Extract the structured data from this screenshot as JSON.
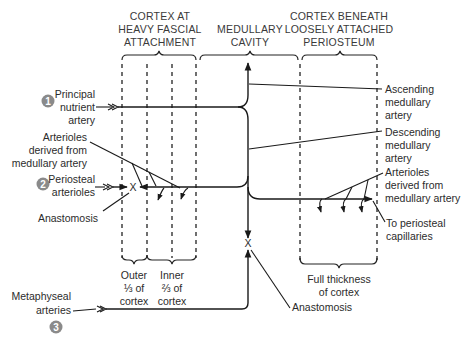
{
  "headers": {
    "left": [
      "CORTEX AT",
      "HEAVY FASCIAL",
      "ATTACHMENT"
    ],
    "middle": [
      "MEDULLARY",
      "CAVITY"
    ],
    "right": [
      "CORTEX BENEATH",
      "LOOSELY ATTACHED",
      "PERIOSTEUM"
    ]
  },
  "markers": {
    "one": "1",
    "two": "2",
    "three": "3"
  },
  "left_labels": {
    "principal": [
      "Principal",
      "nutrient",
      "artery"
    ],
    "arterioles": [
      "Arterioles",
      "derived from",
      "medullary artery"
    ],
    "periosteal": [
      "Periosteal",
      "arterioles"
    ],
    "anastomosis": "Anastomosis",
    "metaphyseal": [
      "Metaphyseal",
      "arteries"
    ]
  },
  "right_labels": {
    "ascending": [
      "Ascending",
      "medullary",
      "artery"
    ],
    "descending": [
      "Descending",
      "medullary",
      "artery"
    ],
    "arterioles": [
      "Arterioles",
      "derived from",
      "medullary artery"
    ],
    "periosteal_cap": [
      "To periosteal",
      "capillaries"
    ]
  },
  "bottom_labels": {
    "outer": [
      "Outer",
      "⅓ of",
      "cortex"
    ],
    "inner": [
      "Inner",
      "⅔ of",
      "cortex"
    ],
    "full": [
      "Full thickness",
      "of cortex"
    ],
    "anastomosis": "Anastomosis"
  },
  "symbols": {
    "anastomosis_mark": "X"
  }
}
